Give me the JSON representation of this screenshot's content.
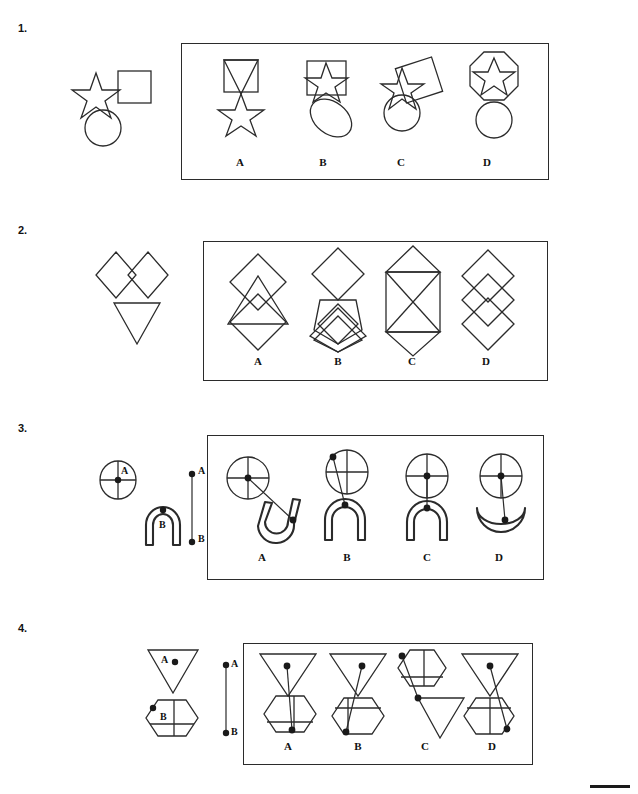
{
  "page": {
    "footer_mark": ""
  },
  "questions": [
    {
      "number": "1.",
      "stem_description": "five-pointed star, square, and circle shown separately",
      "stem_shapes": [
        "star",
        "square",
        "circle"
      ],
      "options": [
        {
          "label": "A",
          "description": "square containing a downward triangle, with a star below"
        },
        {
          "label": "B",
          "description": "square containing a star, with a tilted ellipse below"
        },
        {
          "label": "C",
          "description": "tilted square overlapped by a star on the left, circle below"
        },
        {
          "label": "D",
          "description": "octagon containing a star, with a circle below"
        }
      ]
    },
    {
      "number": "2.",
      "stem_description": "two diamonds side by side above a downward triangle",
      "stem_shapes": [
        "diamond",
        "diamond",
        "triangle-down"
      ],
      "options": [
        {
          "label": "A",
          "description": "two overlapping diamonds stacked with a downward triangle overlaid"
        },
        {
          "label": "B",
          "description": "diamond above a pentagon with a small diamond and a large diamond below"
        },
        {
          "label": "C",
          "description": "rectangle with an X inside flanked by triangles top and bottom"
        },
        {
          "label": "D",
          "description": "three overlapping diamonds in a vertical chain"
        }
      ]
    },
    {
      "number": "3.",
      "stem_description": "circle with crosshair marked A and an arch marked B, joined by segment A to B",
      "stem_shapes": [
        "circle-crosshair",
        "arch",
        "segment-ab"
      ],
      "point_labels": {
        "top": "A",
        "bottom": "B"
      },
      "shape_labels": {
        "first": "A",
        "second": "B"
      },
      "options": [
        {
          "label": "A",
          "description": "circle joined by a long diagonal to a tilted arch"
        },
        {
          "label": "B",
          "description": "circle joined from its upper-left point down to an arch"
        },
        {
          "label": "C",
          "description": "circle directly above an arch, points touching"
        },
        {
          "label": "D",
          "description": "circle joined to a crescent below"
        }
      ]
    },
    {
      "number": "4.",
      "stem_description": "downward triangle marked A and a hexagon marked B, joined by segment A to B",
      "stem_shapes": [
        "triangle-down",
        "hexagon-grid",
        "segment-ab"
      ],
      "point_labels": {
        "top": "A",
        "bottom": "B"
      },
      "shape_labels": {
        "first": "A",
        "second": "B"
      },
      "options": [
        {
          "label": "A",
          "description": "downward triangle above a hexagon with the connector to the hexagon base"
        },
        {
          "label": "B",
          "description": "downward triangle above a hexagon with the connector to the lower-left of the hexagon"
        },
        {
          "label": "C",
          "description": "hexagon at top left connected to a downward triangle at lower right"
        },
        {
          "label": "D",
          "description": "downward triangle above a hexagon with the connector to the hexagon right side"
        }
      ]
    }
  ]
}
